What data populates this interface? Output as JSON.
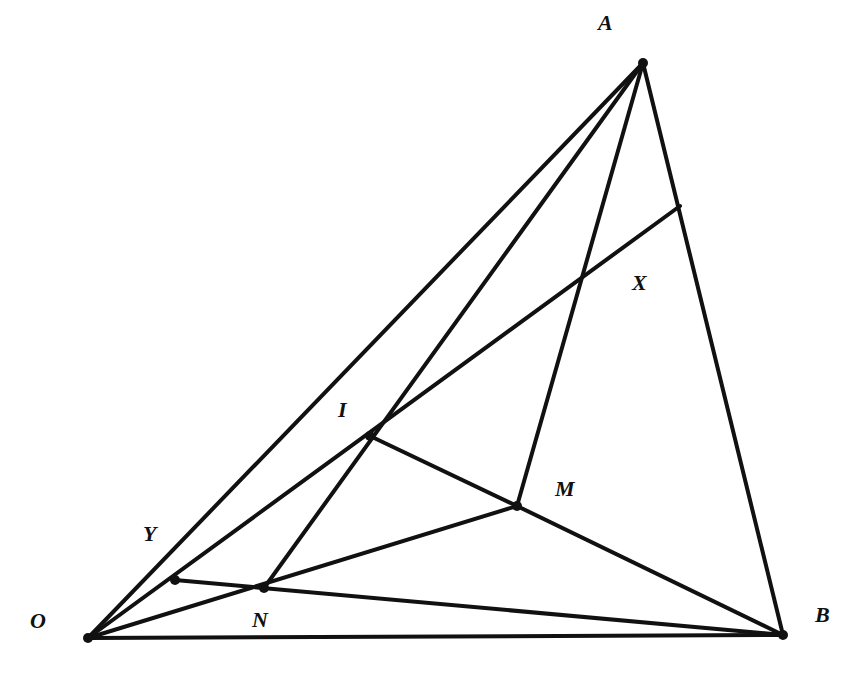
{
  "diagram": {
    "type": "geometry",
    "points": {
      "O": {
        "label": "O",
        "x": 88,
        "y": 638,
        "lx": 30,
        "ly": 628,
        "dot": true
      },
      "A": {
        "label": "A",
        "x": 643,
        "y": 63,
        "lx": 598,
        "ly": 30,
        "dot": true
      },
      "B": {
        "label": "B",
        "x": 783,
        "y": 635,
        "lx": 815,
        "ly": 622,
        "dot": true
      },
      "I": {
        "label": "I",
        "x": 370,
        "y": 436,
        "lx": 338,
        "ly": 417,
        "dot": true
      },
      "M": {
        "label": "M",
        "x": 517,
        "y": 506,
        "lx": 555,
        "ly": 496,
        "dot": true
      },
      "N": {
        "label": "N",
        "x": 264,
        "y": 588,
        "lx": 252,
        "ly": 627,
        "dot": true
      },
      "Y": {
        "label": "Y",
        "x": 175,
        "y": 580,
        "lx": 143,
        "ly": 541,
        "dot": true
      },
      "X": {
        "label": "X",
        "x": 588,
        "y": 275,
        "lx": 632,
        "ly": 290,
        "dot": false
      },
      "P": {
        "label": "",
        "x": 680,
        "y": 206,
        "dot": false
      }
    },
    "segments": [
      [
        "O",
        "A"
      ],
      [
        "O",
        "B"
      ],
      [
        "A",
        "B"
      ],
      [
        "A",
        "N"
      ],
      [
        "O",
        "P"
      ],
      [
        "A",
        "M"
      ],
      [
        "I",
        "M"
      ],
      [
        "M",
        "B"
      ],
      [
        "O",
        "M"
      ],
      [
        "Y",
        "B"
      ]
    ]
  }
}
